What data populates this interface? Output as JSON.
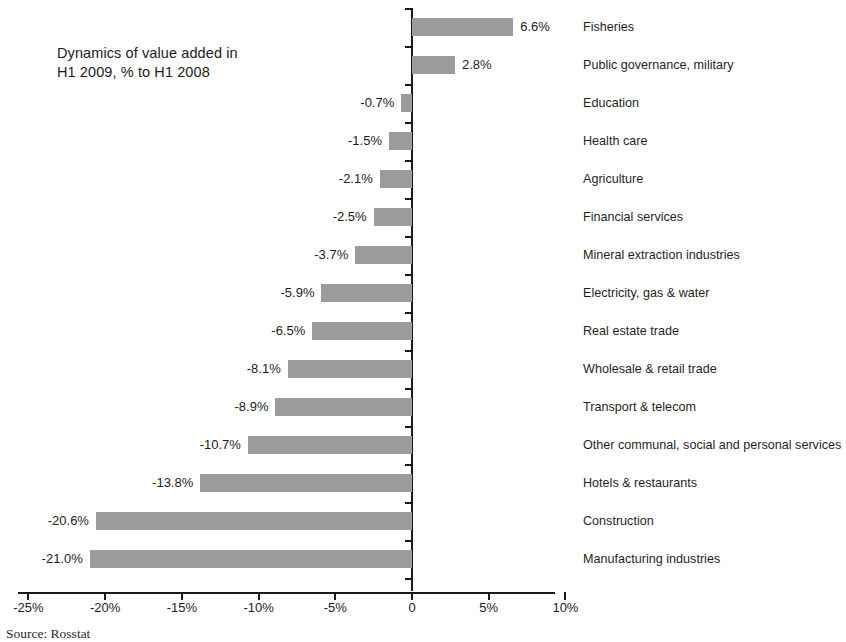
{
  "chart_data": {
    "type": "bar",
    "orientation": "horizontal",
    "title": "Dynamics of value added in\nH1 2009, % to H1 2008",
    "xlabel": "",
    "ylabel": "",
    "xlim": [
      -25,
      10
    ],
    "grid": false,
    "legend": null,
    "unit": "%",
    "bar_color": "#9b9b9b",
    "axis_color": "#1a1a1a",
    "background": "#ffffff",
    "categories": [
      "Fisheries",
      "Public governance, military",
      "Education",
      "Health care",
      "Agriculture",
      "Financial services",
      "Mineral extraction industries",
      "Electricity, gas & water",
      "Real estate trade",
      "Wholesale & retail trade",
      "Transport & telecom",
      "Other communal, social and personal services",
      "Hotels & restaurants",
      "Construction",
      "Manufacturing industries"
    ],
    "values": [
      6.6,
      2.8,
      -0.7,
      -1.5,
      -2.1,
      -2.5,
      -3.7,
      -5.9,
      -6.5,
      -8.1,
      -8.9,
      -10.7,
      -13.8,
      -20.6,
      -21.0
    ],
    "data_labels": [
      "6.6%",
      "2.8%",
      "-0.7%",
      "-1.5%",
      "-2.1%",
      "-2.5%",
      "-3.7%",
      "-5.9%",
      "-6.5%",
      "-8.1%",
      "-8.9%",
      "-10.7%",
      "-13.8%",
      "-20.6%",
      "-21.0%"
    ],
    "xticks": [
      -25,
      -20,
      -15,
      -10,
      -5,
      0,
      5,
      10
    ],
    "xtick_labels": [
      "-25%",
      "-20%",
      "-15%",
      "-10%",
      "-5%",
      "0",
      "5%",
      "10%"
    ]
  },
  "source": {
    "note": "Source: Rosstat"
  }
}
